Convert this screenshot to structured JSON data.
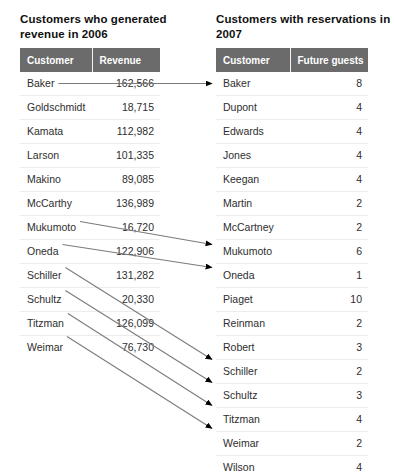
{
  "left_panel": {
    "title": "Customers who generated revenue in 2006",
    "columns": [
      "Customer",
      "Revenue"
    ],
    "rows": [
      {
        "customer": "Baker",
        "revenue": "162,566"
      },
      {
        "customer": "Goldschmidt",
        "revenue": "18,715"
      },
      {
        "customer": "Kamata",
        "revenue": "112,982"
      },
      {
        "customer": "Larson",
        "revenue": "101,335"
      },
      {
        "customer": "Makino",
        "revenue": "89,085"
      },
      {
        "customer": "McCarthy",
        "revenue": "136,989"
      },
      {
        "customer": "Mukumoto",
        "revenue": "16,720"
      },
      {
        "customer": "Oneda",
        "revenue": "122,906"
      },
      {
        "customer": "Schiller",
        "revenue": "131,282"
      },
      {
        "customer": "Schultz",
        "revenue": "20,330"
      },
      {
        "customer": "Titzman",
        "revenue": "126,099"
      },
      {
        "customer": "Weimar",
        "revenue": "76,730"
      }
    ]
  },
  "right_panel": {
    "title": "Customers with reservations in 2007",
    "columns": [
      "Customer",
      "Future guests"
    ],
    "rows": [
      {
        "customer": "Baker",
        "future_guests": "8"
      },
      {
        "customer": "Dupont",
        "future_guests": "4"
      },
      {
        "customer": "Edwards",
        "future_guests": "4"
      },
      {
        "customer": "Jones",
        "future_guests": "4"
      },
      {
        "customer": "Keegan",
        "future_guests": "4"
      },
      {
        "customer": "Martin",
        "future_guests": "2"
      },
      {
        "customer": "McCartney",
        "future_guests": "2"
      },
      {
        "customer": "Mukumoto",
        "future_guests": "6"
      },
      {
        "customer": "Oneda",
        "future_guests": "1"
      },
      {
        "customer": "Piaget",
        "future_guests": "10"
      },
      {
        "customer": "Reinman",
        "future_guests": "2"
      },
      {
        "customer": "Robert",
        "future_guests": "3"
      },
      {
        "customer": "Schiller",
        "future_guests": "2"
      },
      {
        "customer": "Schultz",
        "future_guests": "3"
      },
      {
        "customer": "Titzman",
        "future_guests": "4"
      },
      {
        "customer": "Weimar",
        "future_guests": "2"
      },
      {
        "customer": "Wilson",
        "future_guests": "4"
      }
    ]
  },
  "connections": [
    {
      "from": "Baker",
      "to": "Baker"
    },
    {
      "from": "Mukumoto",
      "to": "Mukumoto"
    },
    {
      "from": "Oneda",
      "to": "Oneda"
    },
    {
      "from": "Schiller",
      "to": "Schiller"
    },
    {
      "from": "Schultz",
      "to": "Schultz"
    },
    {
      "from": "Titzman",
      "to": "Titzman"
    },
    {
      "from": "Weimar",
      "to": "Weimar"
    }
  ],
  "style": {
    "header_background": "#6b6b6b",
    "header_text": "#ffffff",
    "body_text": "#2e2e2e",
    "connector_color": "#7a7a7a",
    "page_background": "#ffffff"
  }
}
